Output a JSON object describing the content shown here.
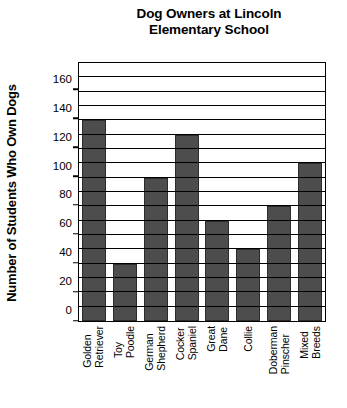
{
  "chart_data": {
    "type": "bar",
    "title": "Dog Owners at Lincoln Elementary School",
    "title_lines": [
      "Dog Owners at Lincoln",
      "Elementary School"
    ],
    "xlabel": "",
    "ylabel": "Number of Students Who Own Dogs",
    "categories": [
      "Golden Retriever",
      "Toy Poodle",
      "German Shepherd",
      "Cocker Spaniel",
      "Great Dane",
      "Collie",
      "Doberman Pinscher",
      "Mixed Breeds"
    ],
    "category_lines": [
      [
        "Golden",
        "Retriever"
      ],
      [
        "Toy",
        "Poodle"
      ],
      [
        "German",
        "Shepherd"
      ],
      [
        "Cocker",
        "Spaniel"
      ],
      [
        "Great",
        "Dane"
      ],
      [
        "Collie"
      ],
      [
        "Doberman",
        "Pinscher"
      ],
      [
        "Mixed",
        "Breeds"
      ]
    ],
    "values": [
      140,
      40,
      100,
      130,
      70,
      50,
      80,
      110
    ],
    "ylim": [
      0,
      180
    ],
    "yticks": [
      0,
      20,
      40,
      60,
      80,
      100,
      120,
      140,
      160
    ],
    "ytick_labels": [
      "0",
      "20",
      "40",
      "60",
      "80",
      "100",
      "120",
      "140",
      "160"
    ],
    "gridlines": [
      10,
      20,
      30,
      40,
      50,
      60,
      70,
      80,
      90,
      100,
      110,
      120,
      130,
      140,
      150,
      160,
      170
    ],
    "grid": true,
    "legend": null,
    "bar_color": "#4d4d4d",
    "axis_color": "#000000",
    "background_color": "#ffffff"
  }
}
